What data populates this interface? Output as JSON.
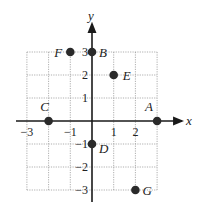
{
  "diagram": {
    "type": "coordinate-plane",
    "axes": {
      "x_label": "x",
      "y_label": "y",
      "x_range": [
        -3,
        3
      ],
      "y_range": [
        -3,
        3
      ],
      "grid": true
    },
    "x_ticks": [
      {
        "value": -3,
        "label": "−3"
      },
      {
        "value": -1,
        "label": "−1"
      },
      {
        "value": 1,
        "label": "1"
      },
      {
        "value": 2,
        "label": "2"
      }
    ],
    "y_ticks": [
      {
        "value": 3,
        "label": "3"
      },
      {
        "value": 2,
        "label": "2"
      },
      {
        "value": 1,
        "label": "1"
      },
      {
        "value": -1,
        "label": "−1"
      },
      {
        "value": -2,
        "label": "−2"
      },
      {
        "value": -3,
        "label": "−3"
      }
    ],
    "points": [
      {
        "name": "A",
        "x": 3,
        "y": 0
      },
      {
        "name": "B",
        "x": 0,
        "y": 3
      },
      {
        "name": "C",
        "x": -2,
        "y": 0
      },
      {
        "name": "D",
        "x": 0,
        "y": -1
      },
      {
        "name": "E",
        "x": 1,
        "y": 2
      },
      {
        "name": "F",
        "x": -1,
        "y": 3
      },
      {
        "name": "G",
        "x": 2,
        "y": -3
      }
    ],
    "colors": {
      "point": "#2a2a2a",
      "axis": "#1a1a1a",
      "grid": "#9a9a9a"
    }
  }
}
